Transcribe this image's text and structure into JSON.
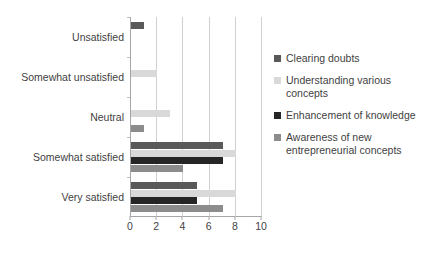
{
  "chart_data": {
    "type": "bar",
    "orientation": "horizontal",
    "title": "",
    "subtitle": "",
    "xlabel": "",
    "ylabel": "",
    "xlim": [
      0,
      10
    ],
    "xticks": [
      0,
      2,
      4,
      6,
      8,
      10
    ],
    "xtick_labels": [
      "0",
      "2",
      "4",
      "6",
      "8",
      "10"
    ],
    "grid": true,
    "grid_axis": "x",
    "legend_position": "right",
    "categories": [
      "Unsatisfied",
      "Somewhat unsatisfied",
      "Neutral",
      "Somewhat satisfied",
      "Very satisfied"
    ],
    "series": [
      {
        "name": "Clearing doubts",
        "color": "#595959",
        "values": [
          1,
          0,
          0,
          7,
          5
        ]
      },
      {
        "name": "Understanding various concepts",
        "color": "#d9d9d9",
        "values": [
          0,
          2,
          3,
          8,
          8
        ]
      },
      {
        "name": "Enhancement of knowledge",
        "color": "#262626",
        "values": [
          0,
          0,
          0,
          7,
          5
        ]
      },
      {
        "name": "Awareness of new entrepreneurial concepts",
        "color": "#8c8c8c",
        "values": [
          0,
          0,
          1,
          4,
          7
        ]
      }
    ]
  },
  "legend": {
    "items": [
      {
        "label": "Clearing doubts",
        "color": "#595959"
      },
      {
        "label": "Understanding various concepts",
        "color": "#d9d9d9"
      },
      {
        "label": "Enhancement of knowledge",
        "color": "#262626"
      },
      {
        "label": "Awareness of new entrepreneurial concepts",
        "color": "#8c8c8c"
      }
    ]
  },
  "style": {
    "background": "#ffffff",
    "text_color": "#3f3f3f",
    "gridline_color": "#d0d0d0",
    "axis_color": "#a6a6a6"
  }
}
